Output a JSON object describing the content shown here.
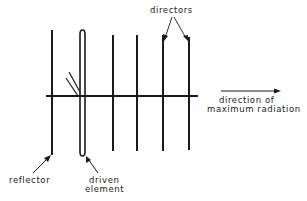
{
  "diagram": {
    "labels": {
      "directors": "directors",
      "direction_line1": "direction of",
      "direction_line2": "maximum radiation",
      "reflector": "reflector",
      "driven_line1": "driven",
      "driven_line2": "element"
    },
    "elements": [
      {
        "name": "reflector",
        "x": 52,
        "y_top": 30,
        "y_bottom": 155
      },
      {
        "name": "driven element",
        "type": "folded dipole",
        "x_left": 80,
        "x_right": 85,
        "y_top": 30,
        "y_bottom": 155
      },
      {
        "name": "director 1",
        "x": 113,
        "y_top": 35,
        "y_bottom": 151
      },
      {
        "name": "director 2",
        "x": 137,
        "y_top": 35,
        "y_bottom": 151
      },
      {
        "name": "director 3",
        "x": 163,
        "y_top": 35,
        "y_bottom": 151
      },
      {
        "name": "director 4",
        "x": 189,
        "y_top": 37,
        "y_bottom": 150
      }
    ],
    "boom": {
      "x_start": 46,
      "x_end": 198,
      "y": 96
    },
    "line_color": "#1a1a1a",
    "background": "#ffffff"
  }
}
